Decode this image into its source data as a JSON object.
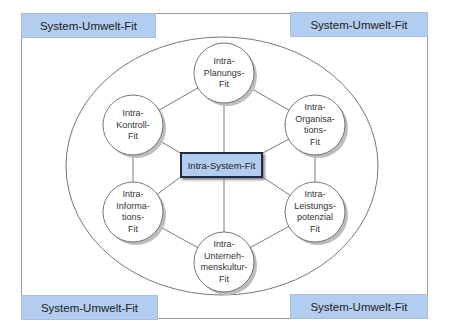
{
  "corners": {
    "top_left": "System-Umwelt-Fit",
    "top_right": "System-Umwelt-Fit",
    "bottom_left": "System-Umwelt-Fit",
    "bottom_right": "System-Umwelt-Fit"
  },
  "center": {
    "label": "Intra-System-Fit"
  },
  "nodes": [
    {
      "id": "planung",
      "lines": [
        "Intra-",
        "Planungs-",
        "Fit"
      ]
    },
    {
      "id": "organisation",
      "lines": [
        "Intra-",
        "Organisa-",
        "tions-",
        "Fit"
      ]
    },
    {
      "id": "leistungspotenzial",
      "lines": [
        "Intra-",
        "Leistungs-",
        "potenzial",
        "Fit"
      ]
    },
    {
      "id": "unternehmenskultur",
      "lines": [
        "Intra-",
        "Unterneh-",
        "menskultur-",
        "Fit"
      ]
    },
    {
      "id": "information",
      "lines": [
        "Intra-",
        "Informa-",
        "tions-",
        "Fit"
      ]
    },
    {
      "id": "kontrolle",
      "lines": [
        "Intra-",
        "Kontroll-",
        "Fit"
      ]
    }
  ],
  "colors": {
    "box_fill": "#b3cdf0",
    "center_border": "#1f2a44",
    "line": "#555555"
  }
}
